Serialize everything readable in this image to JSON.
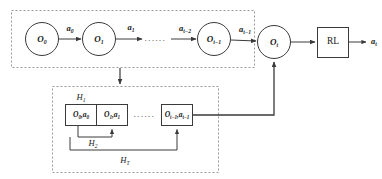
{
  "figure": {
    "type": "block-diagram",
    "title": "",
    "background_color": "#ffffff",
    "line_color": "#3a3a3a",
    "dashed_box_color": "#9a9a9a",
    "text_color": "#1a1a1a"
  },
  "observation_chain": {
    "group_label": "",
    "nodes": [
      {
        "id": "o0",
        "label": "O",
        "subscript": "0"
      },
      {
        "id": "o1",
        "label": "O",
        "subscript": "1"
      },
      {
        "id": "ot_minus_1",
        "label": "O",
        "subscript": "t−1"
      },
      {
        "id": "ot",
        "label": "O",
        "subscript": "t"
      }
    ],
    "edges": [
      {
        "label": "a",
        "subscript": "0"
      },
      {
        "label": "a",
        "subscript": "1"
      },
      {
        "label": "a",
        "subscript": "t−2"
      },
      {
        "label": "a",
        "subscript": "t−1"
      }
    ],
    "ellipsis": "······"
  },
  "rl_block": {
    "label": "RL",
    "output": {
      "label": "a",
      "subscript": "t"
    }
  },
  "history_group": {
    "cells": [
      {
        "obs": "O",
        "obs_sub": "0",
        "act": "a",
        "act_sub": "0"
      },
      {
        "obs": "O",
        "obs_sub": "1",
        "act": "a",
        "act_sub": "1"
      },
      {
        "obs": "O",
        "obs_sub": "t−1",
        "act": "a",
        "act_sub": "t−1"
      }
    ],
    "ellipsis": "······",
    "brackets": [
      {
        "id": "h1",
        "label": "H",
        "subscript": "1"
      },
      {
        "id": "h2",
        "label": "H",
        "subscript": "2"
      },
      {
        "id": "hT",
        "label": "H",
        "subscript": "T"
      }
    ]
  }
}
